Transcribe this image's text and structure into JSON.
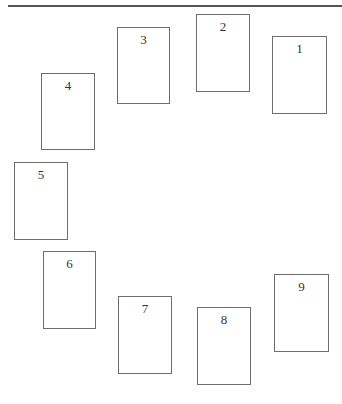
{
  "diagram": {
    "type": "card-spread-layout",
    "top_rule": {
      "color": "#555555"
    },
    "card_border_color": "#6e6e6e",
    "cards": [
      {
        "label": "1",
        "x": 272,
        "y": 36,
        "w": 55,
        "h": 78
      },
      {
        "label": "2",
        "x": 196,
        "y": 14,
        "w": 54,
        "h": 78
      },
      {
        "label": "3",
        "x": 117,
        "y": 27,
        "w": 53,
        "h": 77
      },
      {
        "label": "4",
        "x": 41,
        "y": 73,
        "w": 54,
        "h": 77
      },
      {
        "label": "5",
        "x": 14,
        "y": 162,
        "w": 54,
        "h": 78
      },
      {
        "label": "6",
        "x": 43,
        "y": 251,
        "w": 53,
        "h": 78
      },
      {
        "label": "7",
        "x": 118,
        "y": 296,
        "w": 54,
        "h": 78
      },
      {
        "label": "8",
        "x": 197,
        "y": 307,
        "w": 54,
        "h": 78
      },
      {
        "label": "9",
        "x": 274,
        "y": 274,
        "w": 55,
        "h": 78
      }
    ]
  }
}
